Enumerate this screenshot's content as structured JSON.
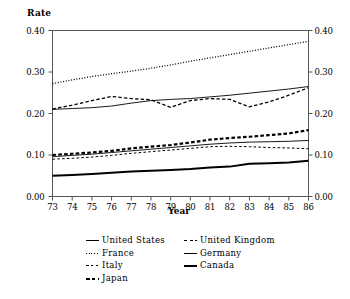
{
  "chart_data": {
    "type": "line",
    "title": "",
    "ylabel": "Rate",
    "xlabel": "Year",
    "ylim": [
      0.0,
      0.4
    ],
    "yticks": [
      "0.00",
      "0.10",
      "0.20",
      "0.30",
      "0.40"
    ],
    "ytick_values": [
      0.0,
      0.1,
      0.2,
      0.3,
      0.4
    ],
    "grid": false,
    "dual_y_axis": true,
    "legend_position": "bottom",
    "x": [
      73,
      74,
      75,
      76,
      77,
      78,
      79,
      80,
      81,
      82,
      83,
      84,
      85,
      86
    ],
    "categories": [
      "73",
      "74",
      "75",
      "76",
      "77",
      "78",
      "79",
      "80",
      "81",
      "82",
      "83",
      "84",
      "85",
      "86"
    ],
    "series": [
      {
        "name": "United States",
        "style": "solid-thin",
        "values": [
          0.21,
          0.212,
          0.214,
          0.218,
          0.225,
          0.231,
          0.234,
          0.236,
          0.24,
          0.244,
          0.249,
          0.254,
          0.259,
          0.265
        ]
      },
      {
        "name": "France",
        "style": "dotted",
        "values": [
          0.272,
          0.281,
          0.289,
          0.296,
          0.302,
          0.309,
          0.317,
          0.326,
          0.334,
          0.342,
          0.35,
          0.358,
          0.366,
          0.374
        ]
      },
      {
        "name": "Italy",
        "style": "dashed-fine",
        "values": [
          0.09,
          0.092,
          0.095,
          0.099,
          0.104,
          0.108,
          0.112,
          0.116,
          0.12,
          0.121,
          0.12,
          0.118,
          0.117,
          0.115
        ]
      },
      {
        "name": "Japan",
        "style": "dashed-thick",
        "values": [
          0.1,
          0.103,
          0.106,
          0.11,
          0.116,
          0.12,
          0.124,
          0.13,
          0.137,
          0.141,
          0.144,
          0.148,
          0.152,
          0.16
        ]
      },
      {
        "name": "United Kingdom",
        "style": "dashed-medium",
        "values": [
          0.211,
          0.22,
          0.231,
          0.241,
          0.236,
          0.233,
          0.215,
          0.231,
          0.236,
          0.234,
          0.216,
          0.228,
          0.244,
          0.262
        ]
      },
      {
        "name": "Germany",
        "style": "solid-thin-2",
        "values": [
          0.096,
          0.099,
          0.102,
          0.106,
          0.11,
          0.114,
          0.118,
          0.122,
          0.126,
          0.129,
          0.131,
          0.132,
          0.133,
          0.135
        ]
      },
      {
        "name": "Canada",
        "style": "solid-thick",
        "values": [
          0.05,
          0.052,
          0.054,
          0.057,
          0.06,
          0.062,
          0.064,
          0.066,
          0.07,
          0.072,
          0.079,
          0.08,
          0.082,
          0.086
        ]
      }
    ]
  },
  "axes": {
    "y_label_text": "Rate",
    "x_label_text": "Year",
    "y_left_ticks": [
      "0.40",
      "0.30",
      "0.20",
      "0.10",
      "0.00"
    ],
    "y_right_ticks": [
      "0.40",
      "0.30",
      "0.20",
      "0.10",
      "0.00"
    ],
    "x_ticks": [
      "73",
      "74",
      "75",
      "76",
      "77",
      "78",
      "79",
      "80",
      "81",
      "82",
      "83",
      "84",
      "85",
      "86"
    ]
  },
  "legend": {
    "column_one": [
      {
        "label": "United States",
        "style": "solid-thin"
      },
      {
        "label": "France",
        "style": "dotted"
      },
      {
        "label": "Italy",
        "style": "dashed-fine"
      },
      {
        "label": "Japan",
        "style": "dashed-thick"
      }
    ],
    "column_two": [
      {
        "label": "United Kingdom",
        "style": "dashed-medium"
      },
      {
        "label": "Germany",
        "style": "solid-thin-2"
      },
      {
        "label": "Canada",
        "style": "solid-thick"
      }
    ]
  },
  "colors": {
    "axis": "#555555",
    "ink": "#000000",
    "background": "#ffffff"
  }
}
